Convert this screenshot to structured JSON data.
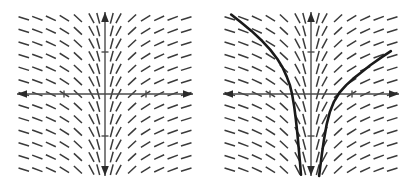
{
  "figure": {
    "title": "",
    "caption": "",
    "background_color": "#ffffff",
    "panel_count": 2,
    "panels": [
      {
        "name": "slope-field-only",
        "label": ""
      },
      {
        "name": "slope-field-with-solutions",
        "label": ""
      }
    ]
  },
  "chart_data": {
    "type": "scatter",
    "title": "",
    "subtitle": "",
    "xlabel": "",
    "ylabel": "",
    "xlim": [
      -3.25,
      3.25
    ],
    "ylim": [
      -3.25,
      3.25
    ],
    "grid": false,
    "legend": null,
    "plot_kind": "slope-field",
    "equation_form": "dy/dx = 1/x",
    "slope_rule": "slope depends on x only; steep (near vertical) close to x = 0, shallow far from x = 0; negative slope for x < 0, positive slope for x > 0",
    "axes": {
      "x_axis": {
        "from": [
          -3.25,
          0
        ],
        "to": [
          3.25,
          0
        ],
        "arrows": "both",
        "ticks": [
          -2,
          2
        ],
        "tick_labels": [
          "",
          ""
        ]
      },
      "y_axis": {
        "from": [
          0,
          -3.25
        ],
        "to": [
          0,
          3.25
        ],
        "arrows": "both",
        "ticks": [
          -2,
          2
        ],
        "tick_labels": [
          "",
          ""
        ]
      }
    },
    "grid_points": {
      "x_values": [
        -3.0,
        -2.5,
        -2.0,
        -1.5,
        -1.0,
        -0.5,
        -0.25,
        0.25,
        0.5,
        1.0,
        1.5,
        2.0,
        2.5,
        3.0
      ],
      "y_values": [
        3.0,
        2.5,
        2.0,
        1.5,
        1.0,
        0.5,
        0.0,
        -0.5,
        -1.0,
        -1.5,
        -2.0,
        -2.5,
        -3.0
      ],
      "columns": 14,
      "rows": 13
    },
    "slopes_by_x": [
      {
        "x": -3.0,
        "slope": -0.333
      },
      {
        "x": -2.5,
        "slope": -0.4
      },
      {
        "x": -2.0,
        "slope": -0.5
      },
      {
        "x": -1.5,
        "slope": -0.667
      },
      {
        "x": -1.0,
        "slope": -1.0
      },
      {
        "x": -0.5,
        "slope": -2.0
      },
      {
        "x": -0.25,
        "slope": -4.0
      },
      {
        "x": 0.25,
        "slope": 4.0
      },
      {
        "x": 0.5,
        "slope": 2.0
      },
      {
        "x": 1.0,
        "slope": 1.0
      },
      {
        "x": 1.5,
        "slope": 0.667
      },
      {
        "x": 2.0,
        "slope": 0.5
      },
      {
        "x": 2.5,
        "slope": 0.4
      },
      {
        "x": 3.0,
        "slope": 0.333
      }
    ],
    "solution_curves": [
      {
        "name": "left-branch",
        "domain": "x < 0",
        "points": [
          [
            -2.95,
            3.15
          ],
          [
            -2.6,
            2.85
          ],
          [
            -2.2,
            2.5
          ],
          [
            -1.8,
            2.1
          ],
          [
            -1.5,
            1.75
          ],
          [
            -1.25,
            1.4
          ],
          [
            -1.05,
            1.05
          ],
          [
            -0.9,
            0.7
          ],
          [
            -0.78,
            0.35
          ],
          [
            -0.7,
            0.0
          ],
          [
            -0.62,
            -0.5
          ],
          [
            -0.56,
            -1.0
          ],
          [
            -0.5,
            -1.6
          ],
          [
            -0.45,
            -2.2
          ],
          [
            -0.4,
            -2.8
          ],
          [
            -0.37,
            -3.2
          ]
        ]
      },
      {
        "name": "right-branch",
        "domain": "x > 0",
        "points": [
          [
            2.95,
            1.7
          ],
          [
            2.6,
            1.45
          ],
          [
            2.2,
            1.15
          ],
          [
            1.85,
            0.85
          ],
          [
            1.55,
            0.6
          ],
          [
            1.3,
            0.35
          ],
          [
            1.05,
            0.05
          ],
          [
            0.85,
            -0.3
          ],
          [
            0.7,
            -0.7
          ],
          [
            0.58,
            -1.2
          ],
          [
            0.48,
            -1.8
          ],
          [
            0.4,
            -2.4
          ],
          [
            0.34,
            -2.9
          ],
          [
            0.3,
            -3.25
          ]
        ]
      }
    ]
  },
  "style": {
    "segment_color": "#3a3a3a",
    "axis_color": "#4a4a4a",
    "curve_color": "#1a1a1a",
    "background_color": "#ffffff"
  }
}
